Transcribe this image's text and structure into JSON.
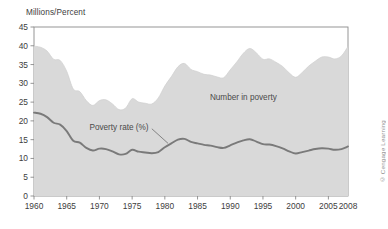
{
  "figure": {
    "axis_title": "Millions/Percent",
    "credit": "© Cengage Learning",
    "annotations": {
      "area_label": "Number in poverty",
      "line_label": "Poverty rate (%)"
    }
  },
  "chart_data": {
    "type": "area",
    "title": "",
    "xlabel": "",
    "ylabel": "Millions/Percent",
    "ylim": [
      0,
      45
    ],
    "xlim": [
      1960,
      2008
    ],
    "ytick_labels": [
      "0",
      "5",
      "10",
      "15",
      "20",
      "25",
      "30",
      "35",
      "40",
      "45"
    ],
    "yticks": [
      0,
      5,
      10,
      15,
      20,
      25,
      30,
      35,
      40,
      45
    ],
    "xtick_labels": [
      "1960",
      "1965",
      "1970",
      "1975",
      "1980",
      "1985",
      "1990",
      "1995",
      "2000",
      "2005",
      "2008"
    ],
    "xticks": [
      1960,
      1965,
      1970,
      1975,
      1980,
      1985,
      1990,
      1995,
      2000,
      2005,
      2008
    ],
    "grid": false,
    "legend_position": "inline-annotations",
    "colors": {
      "area_fill": "#d9d9d9",
      "line": "#7a7a7a",
      "frame": "#8a8a8a",
      "text": "#3d3d3d"
    },
    "x": [
      1960,
      1961,
      1962,
      1963,
      1964,
      1965,
      1966,
      1967,
      1968,
      1969,
      1970,
      1971,
      1972,
      1973,
      1974,
      1975,
      1976,
      1977,
      1978,
      1979,
      1980,
      1981,
      1982,
      1983,
      1984,
      1985,
      1986,
      1987,
      1988,
      1989,
      1990,
      1991,
      1992,
      1993,
      1994,
      1995,
      1996,
      1997,
      1998,
      1999,
      2000,
      2001,
      2002,
      2003,
      2004,
      2005,
      2006,
      2007,
      2008
    ],
    "series": [
      {
        "name": "Number in poverty",
        "unit": "millions",
        "render": "area",
        "values": [
          39.9,
          39.6,
          38.6,
          36.4,
          36.1,
          33.2,
          28.5,
          27.8,
          25.4,
          24.1,
          25.4,
          25.6,
          24.5,
          23.0,
          23.4,
          25.9,
          25.0,
          24.7,
          24.5,
          26.1,
          29.3,
          31.8,
          34.4,
          35.3,
          33.7,
          33.1,
          32.4,
          32.2,
          31.7,
          31.5,
          33.6,
          35.7,
          38.0,
          39.3,
          38.1,
          36.4,
          36.5,
          35.6,
          34.5,
          32.8,
          31.6,
          32.9,
          34.6,
          35.9,
          37.0,
          37.0,
          36.5,
          37.3,
          39.8
        ]
      },
      {
        "name": "Poverty rate (%)",
        "unit": "percent",
        "render": "line",
        "values": [
          22.2,
          21.9,
          21.0,
          19.5,
          19.0,
          17.3,
          14.7,
          14.2,
          12.8,
          12.1,
          12.6,
          12.5,
          11.9,
          11.1,
          11.2,
          12.3,
          11.8,
          11.6,
          11.4,
          11.7,
          13.0,
          14.0,
          15.0,
          15.2,
          14.4,
          14.0,
          13.6,
          13.4,
          13.0,
          12.8,
          13.5,
          14.2,
          14.8,
          15.1,
          14.5,
          13.8,
          13.7,
          13.3,
          12.7,
          11.9,
          11.3,
          11.7,
          12.1,
          12.5,
          12.7,
          12.6,
          12.3,
          12.5,
          13.2
        ]
      }
    ],
    "annotations": [
      {
        "text": "Number in poverty",
        "x": 1992,
        "y": 25.5
      },
      {
        "text": "Poverty rate (%)",
        "x": 1973,
        "y": 17.5,
        "leader_to": {
          "x": 1980.5,
          "y": 14.0
        }
      }
    ]
  }
}
